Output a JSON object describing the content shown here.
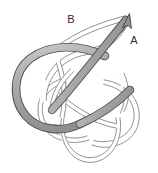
{
  "figure": {
    "kind": "knot-diagram",
    "width": 158,
    "height": 173,
    "background_color": "#ffffff"
  },
  "colors": {
    "background": "#ffffff",
    "tube_fill": "#a8a8a8",
    "tube_fill_light": "#c9c9c9",
    "tube_outline": "#4d4d4d",
    "thin_strand_fill": "#ffffff",
    "thin_strand_outline": "#8c8c8c",
    "label_color": "#2b2b2b"
  },
  "labels": [
    {
      "id": "label-a",
      "text": "A",
      "x": 134,
      "y": 44,
      "anchor": "middle",
      "description": "label on the oriented thick strand near the arrowhead"
    },
    {
      "id": "label-b",
      "text": "B",
      "x": 71,
      "y": 23,
      "anchor": "middle",
      "description": "label on the thin strand at upper left"
    }
  ],
  "arrow": {
    "id": "arrow-a",
    "tip_x": 129,
    "tip_y": 15,
    "direction_degrees": 35,
    "description": "arrowhead at the free end of the thick gray strand pointing up and to the right"
  },
  "strands": {
    "thick_tube": {
      "name": "oriented-thick-strand",
      "stroke_width": 7,
      "description": "Large gray tube forming a big loop on the left that sweeps through the knot and exits upper right with an arrowhead"
    },
    "thin_knot": {
      "name": "thin-knot-strands",
      "stroke_width": 1.1,
      "tube_width": 5,
      "description": "Thin double-outlined white tubes forming an interlaced knot in the lower portion"
    }
  }
}
